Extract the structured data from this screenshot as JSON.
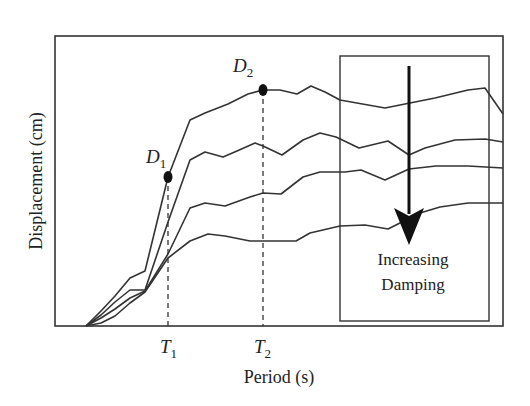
{
  "chart_data": {
    "type": "line",
    "title": "",
    "xlabel": "Period (s)",
    "ylabel": "Displacement (cm)",
    "grid": false,
    "legend": null,
    "x_ticks": [
      {
        "label": "T",
        "sub": "1",
        "x": 169
      },
      {
        "label": "T",
        "sub": "2",
        "x": 263
      }
    ],
    "points": [
      {
        "label": "D",
        "sub": "1",
        "x": 168,
        "y": 177
      },
      {
        "label": "D",
        "sub": "2",
        "x": 263,
        "y": 90
      }
    ],
    "annotation": {
      "line1": "Increasing",
      "line2": "Damping"
    },
    "series": [
      {
        "name": "Damping level 1 (lowest)",
        "points": [
          [
            86,
            326
          ],
          [
            101,
            311
          ],
          [
            115,
            296
          ],
          [
            130,
            278
          ],
          [
            145,
            271
          ],
          [
            168,
            177
          ],
          [
            190,
            120
          ],
          [
            205,
            113
          ],
          [
            228,
            104
          ],
          [
            248,
            94
          ],
          [
            263,
            90
          ],
          [
            280,
            90
          ],
          [
            297,
            94
          ],
          [
            311,
            86
          ],
          [
            325,
            92
          ],
          [
            340,
            100
          ],
          [
            385,
            108
          ],
          [
            405,
            104
          ],
          [
            435,
            98
          ],
          [
            468,
            90
          ],
          [
            485,
            88
          ],
          [
            503,
            114
          ]
        ]
      },
      {
        "name": "Damping level 2",
        "points": [
          [
            86,
            326
          ],
          [
            101,
            315
          ],
          [
            115,
            302
          ],
          [
            130,
            290
          ],
          [
            145,
            290
          ],
          [
            168,
            222
          ],
          [
            190,
            160
          ],
          [
            205,
            152
          ],
          [
            223,
            157
          ],
          [
            237,
            151
          ],
          [
            255,
            143
          ],
          [
            263,
            146
          ],
          [
            282,
            155
          ],
          [
            303,
            140
          ],
          [
            320,
            133
          ],
          [
            336,
            137
          ],
          [
            359,
            148
          ],
          [
            388,
            141
          ],
          [
            409,
            155
          ],
          [
            425,
            148
          ],
          [
            455,
            140
          ],
          [
            485,
            139
          ],
          [
            503,
            142
          ]
        ]
      },
      {
        "name": "Damping level 3",
        "points": [
          [
            86,
            326
          ],
          [
            101,
            318
          ],
          [
            115,
            309
          ],
          [
            130,
            298
          ],
          [
            145,
            291
          ],
          [
            168,
            254
          ],
          [
            190,
            208
          ],
          [
            205,
            203
          ],
          [
            225,
            206
          ],
          [
            250,
            197
          ],
          [
            263,
            193
          ],
          [
            281,
            194
          ],
          [
            303,
            177
          ],
          [
            320,
            172
          ],
          [
            345,
            172
          ],
          [
            361,
            170
          ],
          [
            385,
            180
          ],
          [
            409,
            169
          ],
          [
            436,
            166
          ],
          [
            468,
            166
          ],
          [
            503,
            168
          ]
        ]
      },
      {
        "name": "Damping level 4 (highest)",
        "points": [
          [
            86,
            326
          ],
          [
            101,
            323
          ],
          [
            115,
            316
          ],
          [
            130,
            303
          ],
          [
            145,
            292
          ],
          [
            168,
            258
          ],
          [
            190,
            241
          ],
          [
            208,
            234
          ],
          [
            225,
            236
          ],
          [
            250,
            241
          ],
          [
            263,
            241
          ],
          [
            296,
            241
          ],
          [
            310,
            233
          ],
          [
            340,
            226
          ],
          [
            365,
            225
          ],
          [
            388,
            229
          ],
          [
            420,
            213
          ],
          [
            440,
            207
          ],
          [
            468,
            203
          ],
          [
            503,
            203
          ]
        ]
      }
    ]
  },
  "frame": {
    "x1": 55,
    "y1": 36,
    "x2": 503,
    "y2": 326
  },
  "inner_box": {
    "x1": 340,
    "y1": 56,
    "x2": 489,
    "y2": 321
  },
  "arrow": {
    "x": 409,
    "y_start": 66,
    "y_tip": 245,
    "head_top": 208,
    "head_half_width": 15
  },
  "colors": {
    "line": "#333333",
    "frame": "#333333",
    "arrow": "#111111",
    "text": "#222222"
  }
}
